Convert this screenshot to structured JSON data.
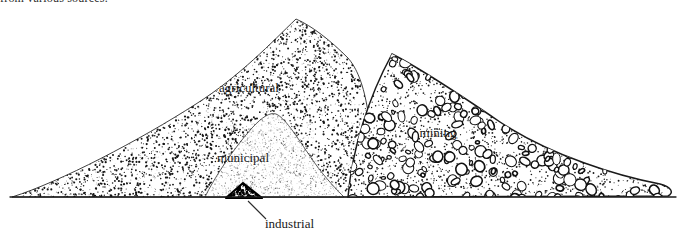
{
  "figure": {
    "clipped_caption": "from various sources.",
    "background_color": "#ffffff",
    "ink_color": "#1a1a1a"
  },
  "labels": {
    "agricultural": "agricultural",
    "mining": "mining",
    "municipal": "municipal",
    "industrial": "industrial"
  },
  "piles": [
    {
      "name": "agricultural",
      "label": "agricultural",
      "texture": "fine-stipple",
      "label_x": 249,
      "label_y": 92,
      "font_size": 13
    },
    {
      "name": "mining",
      "label": "mining",
      "texture": "pebbles",
      "label_x": 438,
      "label_y": 137,
      "font_size": 13
    },
    {
      "name": "municipal",
      "label": "municipal",
      "texture": "light-stipple",
      "label_x": 243,
      "label_y": 162,
      "font_size": 13
    },
    {
      "name": "industrial",
      "label": "industrial",
      "texture": "dark-solid",
      "label_x": 265,
      "label_y": 228,
      "font_size": 13
    }
  ],
  "baseline": {
    "x1": 10,
    "x2": 676,
    "y": 197
  },
  "leader_line": {
    "from_x": 248,
    "from_y": 201,
    "to_x": 266,
    "to_y": 219
  }
}
